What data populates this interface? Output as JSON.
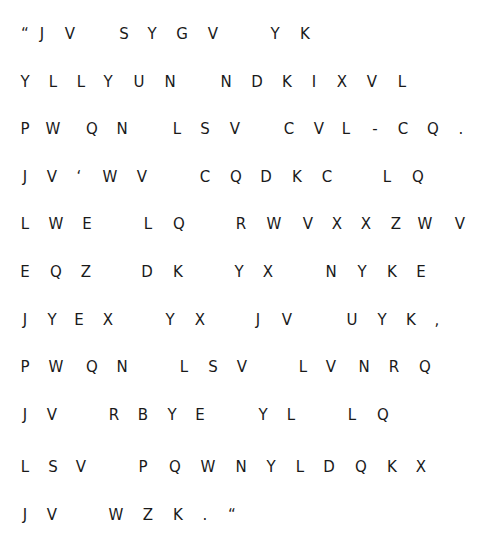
{
  "document": {
    "type": "cipher-text",
    "text_color": "#1a1a1a",
    "background": "#ffffff",
    "lines": [
      {
        "y": 22,
        "glyphs": [
          {
            "c": "“",
            "x": 25
          },
          {
            "c": "J",
            "x": 42
          },
          {
            "c": "V",
            "x": 70
          },
          {
            "c": "S",
            "x": 124
          },
          {
            "c": "Y",
            "x": 152
          },
          {
            "c": "G",
            "x": 182
          },
          {
            "c": "V",
            "x": 213
          },
          {
            "c": "Y",
            "x": 275
          },
          {
            "c": "K",
            "x": 305
          }
        ]
      },
      {
        "y": 70,
        "glyphs": [
          {
            "c": "Y",
            "x": 25
          },
          {
            "c": "L",
            "x": 53
          },
          {
            "c": "L",
            "x": 81
          },
          {
            "c": "Y",
            "x": 108
          },
          {
            "c": "U",
            "x": 139
          },
          {
            "c": "N",
            "x": 170
          },
          {
            "c": "N",
            "x": 226
          },
          {
            "c": "D",
            "x": 257
          },
          {
            "c": "K",
            "x": 287
          },
          {
            "c": "I",
            "x": 314
          },
          {
            "c": "X",
            "x": 342
          },
          {
            "c": "V",
            "x": 372
          },
          {
            "c": "L",
            "x": 402
          }
        ]
      },
      {
        "y": 117,
        "glyphs": [
          {
            "c": "P",
            "x": 25
          },
          {
            "c": "W",
            "x": 53
          },
          {
            "c": "Q",
            "x": 92
          },
          {
            "c": "N",
            "x": 122
          },
          {
            "c": "L",
            "x": 177
          },
          {
            "c": "S",
            "x": 205
          },
          {
            "c": "V",
            "x": 235
          },
          {
            "c": "C",
            "x": 289
          },
          {
            "c": "V",
            "x": 319
          },
          {
            "c": "L",
            "x": 346
          },
          {
            "c": "-",
            "x": 375
          },
          {
            "c": "C",
            "x": 403
          },
          {
            "c": "Q",
            "x": 433
          },
          {
            "c": ".",
            "x": 461
          }
        ]
      },
      {
        "y": 165,
        "glyphs": [
          {
            "c": "J",
            "x": 25
          },
          {
            "c": "V",
            "x": 52
          },
          {
            "c": "‘",
            "x": 79
          },
          {
            "c": "W",
            "x": 110
          },
          {
            "c": "V",
            "x": 142
          },
          {
            "c": "C",
            "x": 205
          },
          {
            "c": "Q",
            "x": 236
          },
          {
            "c": "D",
            "x": 266
          },
          {
            "c": "K",
            "x": 297
          },
          {
            "c": "C",
            "x": 327
          },
          {
            "c": "L",
            "x": 387
          },
          {
            "c": "Q",
            "x": 418
          }
        ]
      },
      {
        "y": 212,
        "glyphs": [
          {
            "c": "L",
            "x": 25
          },
          {
            "c": "W",
            "x": 56
          },
          {
            "c": "E",
            "x": 87
          },
          {
            "c": "L",
            "x": 148
          },
          {
            "c": "Q",
            "x": 179
          },
          {
            "c": "R",
            "x": 241
          },
          {
            "c": "W",
            "x": 274
          },
          {
            "c": "V",
            "x": 308
          },
          {
            "c": "X",
            "x": 337
          },
          {
            "c": "X",
            "x": 366
          },
          {
            "c": "Z",
            "x": 396
          },
          {
            "c": "W",
            "x": 425
          },
          {
            "c": "V",
            "x": 460
          }
        ]
      },
      {
        "y": 260,
        "glyphs": [
          {
            "c": "E",
            "x": 25
          },
          {
            "c": "Q",
            "x": 56
          },
          {
            "c": "Z",
            "x": 86
          },
          {
            "c": "D",
            "x": 147
          },
          {
            "c": "K",
            "x": 178
          },
          {
            "c": "Y",
            "x": 239
          },
          {
            "c": "X",
            "x": 268
          },
          {
            "c": "N",
            "x": 331
          },
          {
            "c": "Y",
            "x": 362
          },
          {
            "c": "K",
            "x": 392
          },
          {
            "c": "E",
            "x": 421
          }
        ]
      },
      {
        "y": 308,
        "glyphs": [
          {
            "c": "J",
            "x": 25
          },
          {
            "c": "Y",
            "x": 52
          },
          {
            "c": "E",
            "x": 79
          },
          {
            "c": "X",
            "x": 108
          },
          {
            "c": "Y",
            "x": 170
          },
          {
            "c": "X",
            "x": 200
          },
          {
            "c": "J",
            "x": 258
          },
          {
            "c": "V",
            "x": 287
          },
          {
            "c": "U",
            "x": 352
          },
          {
            "c": "Y",
            "x": 382
          },
          {
            "c": "K",
            "x": 411
          },
          {
            "c": ",",
            "x": 437
          }
        ]
      },
      {
        "y": 355,
        "glyphs": [
          {
            "c": "P",
            "x": 25
          },
          {
            "c": "W",
            "x": 56
          },
          {
            "c": "Q",
            "x": 92
          },
          {
            "c": "N",
            "x": 122
          },
          {
            "c": "L",
            "x": 184
          },
          {
            "c": "S",
            "x": 213
          },
          {
            "c": "V",
            "x": 242
          },
          {
            "c": "L",
            "x": 303
          },
          {
            "c": "V",
            "x": 331
          },
          {
            "c": "N",
            "x": 364
          },
          {
            "c": "R",
            "x": 394
          },
          {
            "c": "Q",
            "x": 425
          }
        ]
      },
      {
        "y": 403,
        "glyphs": [
          {
            "c": "J",
            "x": 25
          },
          {
            "c": "V",
            "x": 52
          },
          {
            "c": "R",
            "x": 114
          },
          {
            "c": "B",
            "x": 143
          },
          {
            "c": "Y",
            "x": 172
          },
          {
            "c": "E",
            "x": 200
          },
          {
            "c": "Y",
            "x": 263
          },
          {
            "c": "L",
            "x": 291
          },
          {
            "c": "L",
            "x": 352
          },
          {
            "c": "Q",
            "x": 383
          }
        ]
      },
      {
        "y": 455,
        "glyphs": [
          {
            "c": "L",
            "x": 25
          },
          {
            "c": "S",
            "x": 53
          },
          {
            "c": "V",
            "x": 81
          },
          {
            "c": "P",
            "x": 143
          },
          {
            "c": "Q",
            "x": 175
          },
          {
            "c": "W",
            "x": 208
          },
          {
            "c": "N",
            "x": 241
          },
          {
            "c": "Y",
            "x": 271
          },
          {
            "c": "L",
            "x": 300
          },
          {
            "c": "D",
            "x": 329
          },
          {
            "c": "Q",
            "x": 361
          },
          {
            "c": "K",
            "x": 392
          },
          {
            "c": "X",
            "x": 421
          }
        ]
      },
      {
        "y": 503,
        "glyphs": [
          {
            "c": "J",
            "x": 25
          },
          {
            "c": "V",
            "x": 52
          },
          {
            "c": "W",
            "x": 116
          },
          {
            "c": "Z",
            "x": 148
          },
          {
            "c": "K",
            "x": 178
          },
          {
            "c": ".",
            "x": 205
          },
          {
            "c": "“",
            "x": 232
          }
        ]
      }
    ],
    "text_lines": [
      "“J V   S Y G V   Y K",
      "Y L L Y U N   N D K I X V L",
      "P W Q N   L S V   C V L - C Q .",
      "J V ‘ W V   C Q D K C   L Q",
      "L W E   L Q   R W V X X Z W V",
      "E Q Z   D K   Y X   N Y K E",
      "J Y E X   Y X   J V   U Y K ,",
      "P W Q N   L S V   L V N R Q",
      "J V   R B Y E   Y L   L Q",
      "L S V   P Q W N Y L D Q K X",
      "J V   W Z K . “"
    ]
  }
}
